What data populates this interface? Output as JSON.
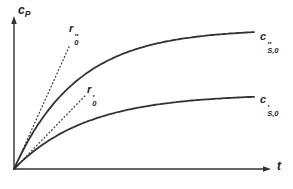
{
  "figure": {
    "background": "#ffffff",
    "ink_color": "#333333",
    "axes": {
      "y_label": {
        "base": "c",
        "sub": "P"
      },
      "x_label": "t"
    },
    "labels": {
      "upper_asymptote": {
        "base": "c",
        "primes": "″",
        "sub": "S,0"
      },
      "lower_asymptote": {
        "base": "c",
        "primes": "′",
        "sub": "S,0"
      },
      "upper_rate": {
        "base": "r",
        "primes": "″",
        "sub": "0"
      },
      "lower_rate": {
        "base": "r",
        "primes": "′",
        "sub": "0"
      }
    }
  },
  "chart_data": {
    "type": "line",
    "title": "",
    "xlabel": "t",
    "ylabel": "cP",
    "axes_numeric": false,
    "grid": false,
    "legend": "inline-annotations",
    "coordinate_space": "pixels-y-down",
    "pixel_geometry": {
      "origin": [
        14,
        169
      ],
      "y_axis_tip": 16,
      "x_axis_tip": 271
    },
    "series": [
      {
        "id": "curve-cs0-double-prime",
        "label": "c″S,0",
        "style": "solid",
        "model": "saturation",
        "amplitude": 140,
        "tau": 63,
        "x_end": 255
      },
      {
        "id": "curve-cs0-prime",
        "label": "c′S,0",
        "style": "solid",
        "model": "saturation",
        "amplitude": 75,
        "tau": 73,
        "x_end": 255
      },
      {
        "id": "tangent-r0-double-prime",
        "label": "r″0",
        "style": "dotted",
        "model": "tangent",
        "slope": 2.22,
        "x_end": 70
      },
      {
        "id": "tangent-r0-prime",
        "label": "r′0",
        "style": "dotted",
        "model": "tangent",
        "slope": 1.03,
        "x_end": 86
      }
    ],
    "annotations": [
      "r″0 and r′0 are dotted initial-slope tangents of the upper and lower curves",
      "c″S,0 and c′S,0 mark the plateau (asymptote) of the upper and lower curves"
    ]
  }
}
